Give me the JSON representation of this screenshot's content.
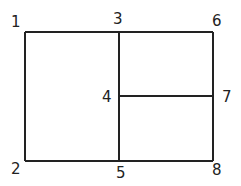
{
  "diagram": {
    "line_color": "#222222",
    "labels": [
      {
        "id": "1",
        "text": "1",
        "x": 11,
        "y": 16
      },
      {
        "id": "2",
        "text": "2",
        "x": 11,
        "y": 162
      },
      {
        "id": "3",
        "text": "3",
        "x": 113,
        "y": 12
      },
      {
        "id": "4",
        "text": "4",
        "x": 102,
        "y": 90
      },
      {
        "id": "5",
        "text": "5",
        "x": 116,
        "y": 166
      },
      {
        "id": "6",
        "text": "6",
        "x": 212,
        "y": 14
      },
      {
        "id": "7",
        "text": "7",
        "x": 222,
        "y": 90
      },
      {
        "id": "8",
        "text": "8",
        "x": 212,
        "y": 163
      }
    ],
    "edges": [
      {
        "from": "1",
        "to": "3"
      },
      {
        "from": "3",
        "to": "6"
      },
      {
        "from": "1",
        "to": "2"
      },
      {
        "from": "2",
        "to": "5"
      },
      {
        "from": "5",
        "to": "8"
      },
      {
        "from": "6",
        "to": "7"
      },
      {
        "from": "7",
        "to": "8"
      },
      {
        "from": "3",
        "to": "4"
      },
      {
        "from": "4",
        "to": "5"
      },
      {
        "from": "4",
        "to": "7"
      }
    ]
  }
}
